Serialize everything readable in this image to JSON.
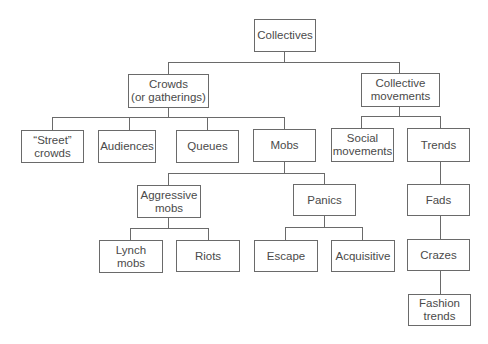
{
  "diagram": {
    "title": "Collectives",
    "type": "hierarchy-tree",
    "colors": {
      "line": "#6a6a6a",
      "text": "#4a4a4a",
      "box_fill": "#ffffff"
    },
    "nodes": {
      "collectives": {
        "label": "Collectives"
      },
      "crowds": {
        "label": "Crowds\n(or gatherings)"
      },
      "collective_movements": {
        "label": "Collective\nmovements"
      },
      "street_crowds": {
        "label": "“Street”\ncrowds"
      },
      "audiences": {
        "label": "Audiences"
      },
      "queues": {
        "label": "Queues"
      },
      "mobs": {
        "label": "Mobs"
      },
      "social_movements": {
        "label": "Social\nmovements"
      },
      "trends": {
        "label": "Trends"
      },
      "aggressive_mobs": {
        "label": "Aggressive\nmobs"
      },
      "panics": {
        "label": "Panics"
      },
      "fads": {
        "label": "Fads"
      },
      "lynch_mobs": {
        "label": "Lynch\nmobs"
      },
      "riots": {
        "label": "Riots"
      },
      "escape": {
        "label": "Escape"
      },
      "acquisitive": {
        "label": "Acquisitive"
      },
      "crazes": {
        "label": "Crazes"
      },
      "fashion_trends": {
        "label": "Fashion\ntrends"
      }
    },
    "edges": [
      [
        "collectives",
        "crowds"
      ],
      [
        "collectives",
        "collective_movements"
      ],
      [
        "crowds",
        "street_crowds"
      ],
      [
        "crowds",
        "audiences"
      ],
      [
        "crowds",
        "queues"
      ],
      [
        "crowds",
        "mobs"
      ],
      [
        "collective_movements",
        "social_movements"
      ],
      [
        "collective_movements",
        "trends"
      ],
      [
        "mobs",
        "aggressive_mobs"
      ],
      [
        "mobs",
        "panics"
      ],
      [
        "aggressive_mobs",
        "lynch_mobs"
      ],
      [
        "aggressive_mobs",
        "riots"
      ],
      [
        "panics",
        "escape"
      ],
      [
        "panics",
        "acquisitive"
      ],
      [
        "trends",
        "fads"
      ],
      [
        "fads",
        "crazes"
      ],
      [
        "crazes",
        "fashion_trends"
      ]
    ]
  }
}
